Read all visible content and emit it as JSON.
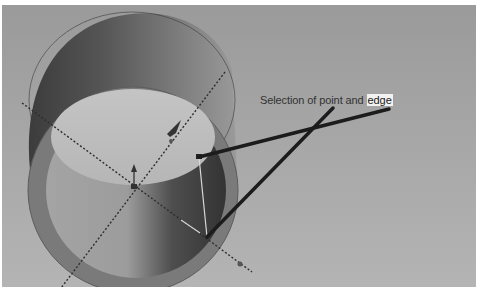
{
  "viewport": {
    "background_top": "#9a9a9a",
    "background_bottom": "#b4b4b4",
    "model": "hollow-cylinder",
    "colors": {
      "outer_wall_dark": "#4a4a4a",
      "outer_wall_light": "#8e8e8e",
      "rim_face": "#777777",
      "inner_wall_light": "#b2b2b2",
      "inner_wall_dark": "#3d3d3d",
      "inner_floor": "#bdbdbd",
      "callout_line": "#1c1c1c",
      "axis_dotted": "#2e2e2e"
    }
  },
  "annotation": {
    "prefix": "Selection of point and",
    "highlight": "edge"
  },
  "callouts": [
    {
      "label": "point-callout",
      "from": [
        333,
        108
      ],
      "to": [
        207,
        237
      ]
    },
    {
      "label": "edge-callout",
      "from": [
        389,
        109
      ],
      "to": [
        199,
        157
      ]
    }
  ],
  "selection": {
    "point": [
      207,
      237
    ],
    "edge_start": [
      199,
      157
    ],
    "edge_end": [
      207,
      237
    ]
  }
}
